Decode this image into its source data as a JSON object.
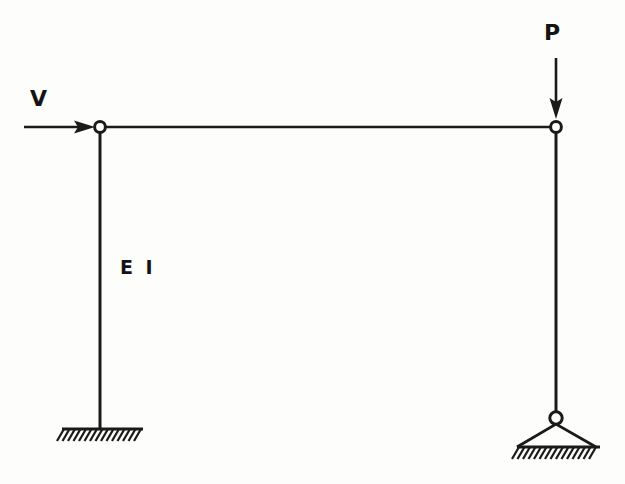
{
  "diagram": {
    "type": "structural-frame-free-body-diagram",
    "background_color": "#fdfdfc",
    "line_color": "#1a1a1a"
  },
  "labels": {
    "horizontal_load": "V",
    "vertical_load": "P",
    "flexural_rigidity": "E I"
  },
  "geometry": {
    "top_left_joint": {
      "x": 100,
      "y": 127
    },
    "top_right_joint": {
      "x": 556,
      "y": 127
    },
    "left_base": {
      "x": 100,
      "y": 429
    },
    "right_pin": {
      "x": 556,
      "y": 418
    },
    "right_ground": {
      "y": 447
    },
    "beam_span": 456,
    "column_height": 302
  },
  "loads": {
    "V": {
      "name": "horizontal-load-V",
      "direction": "right",
      "shaft_start_x": 24,
      "shaft_end_x": 95,
      "y": 127
    },
    "P": {
      "name": "vertical-load-P",
      "direction": "down",
      "x": 556,
      "shaft_start_y": 58,
      "shaft_end_y": 118
    }
  },
  "supports": {
    "left": {
      "type": "fixed-base",
      "hatch_start_x": 62,
      "hatch_end_x": 143,
      "ground_y": 429,
      "hatch_count": 15
    },
    "right": {
      "type": "pinned-triangle",
      "hatch_start_x": 517,
      "hatch_end_x": 600,
      "ground_y": 447,
      "hatch_count": 15,
      "triangle_half_width": 40,
      "triangle_apex_y": 424
    }
  }
}
